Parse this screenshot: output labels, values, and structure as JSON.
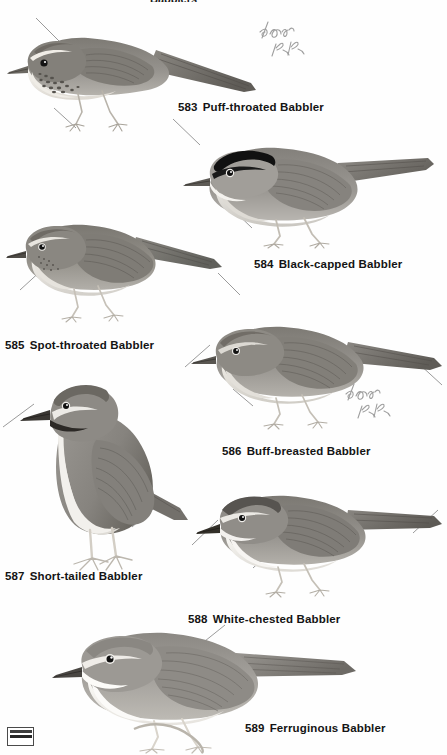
{
  "plate": {
    "title_partial": "Babblers",
    "background_color": "#fefefe",
    "text_color": "#141414",
    "leader_color": "#8e8e8e",
    "annotation_color": "#9a9a9a",
    "width": 447,
    "height": 755
  },
  "entries": [
    {
      "number": "583",
      "name": "Puff-throated Babbler",
      "caption_x": 178,
      "caption_y": 101,
      "bird": {
        "x": 6,
        "y": 28,
        "w": 250,
        "h": 110,
        "pose": "perched-left-facing",
        "plumage": {
          "upper": "#8f8c87",
          "upper_dark": "#6e6b66",
          "crown": "#77736d",
          "breast": "#f2efe9",
          "streaks": "#5e5a55",
          "bill": "#6b6862",
          "legs": "#c8c3ba"
        },
        "features": "streaked breast, pale supercilium, rufous crown, long tail"
      }
    },
    {
      "number": "584",
      "name": "Black-capped Babbler",
      "caption_x": 254,
      "caption_y": 258,
      "bird": {
        "x": 178,
        "y": 140,
        "w": 255,
        "h": 105,
        "pose": "perched-left-facing",
        "plumage": {
          "upper": "#97948f",
          "upper_dark": "#74716c",
          "crown": "#121212",
          "breast": "#d6d3cd",
          "streaks": "#4a4743",
          "bill": "#5d5a55",
          "legs": "#cfcac1"
        },
        "features": "solid black cap, grey underparts, white throat"
      }
    },
    {
      "number": "585",
      "name": "Spot-throated Babbler",
      "caption_x": 5,
      "caption_y": 339,
      "bird": {
        "x": 6,
        "y": 215,
        "w": 220,
        "h": 105,
        "pose": "perched-left-facing",
        "plumage": {
          "upper": "#8b8883",
          "upper_dark": "#6b6862",
          "crown": "#7c7872",
          "breast": "#e8e5df",
          "streaks": "#5a5651",
          "bill": "#4f4c47",
          "legs": "#d2cdc4"
        },
        "features": "faintly spotted throat, plain brown upperparts"
      }
    },
    {
      "number": "586",
      "name": "Buff-breasted Babbler",
      "caption_x": 222,
      "caption_y": 445,
      "bird": {
        "x": 190,
        "y": 318,
        "w": 250,
        "h": 110,
        "pose": "perched-left-facing",
        "plumage": {
          "upper": "#8d8a85",
          "upper_dark": "#6a6762",
          "crown": "#7a7670",
          "breast": "#ddd9d2",
          "streaks": "#56534e",
          "bill": "#595651",
          "legs": "#cbc6bd"
        },
        "features": "buff breast, plain warm brown upperparts"
      }
    },
    {
      "number": "587",
      "name": "Short-tailed Babbler",
      "caption_x": 5,
      "caption_y": 570,
      "bird": {
        "x": 16,
        "y": 378,
        "w": 180,
        "h": 195,
        "pose": "upright-standing",
        "plumage": {
          "upper": "#908d88",
          "upper_dark": "#6f6c67",
          "crown": "#6e6a64",
          "breast": "#edeae4",
          "streaks": "#3c3935",
          "bill": "#3a3733",
          "legs": "#d6d1c8"
        },
        "features": "upright stance, short tail, black malar stripe, white belly"
      }
    },
    {
      "number": "588",
      "name": "White-chested Babbler",
      "caption_x": 188,
      "caption_y": 613,
      "bird": {
        "x": 196,
        "y": 488,
        "w": 245,
        "h": 105,
        "pose": "perched-left-facing",
        "plumage": {
          "upper": "#8c8984",
          "upper_dark": "#6b6863",
          "crown": "#5f5c57",
          "breast": "#f1eee8",
          "streaks": "#545horizontal",
          "bill": "#333029",
          "legs": "#cdc8bf"
        },
        "features": "white chest, dark crown, grey-brown upperparts"
      }
    },
    {
      "number": "589",
      "name": "Ferruginous Babbler",
      "caption_x": 245,
      "caption_y": 722,
      "bird": {
        "x": 56,
        "y": 625,
        "w": 300,
        "h": 125,
        "pose": "perched-left-facing",
        "plumage": {
          "upper": "#9b9893",
          "upper_dark": "#7b7873",
          "crown": "#8a8782",
          "breast": "#f4f1eb",
          "streaks": "#666360",
          "bill": "#4a4743",
          "legs": "#d8d3ca"
        },
        "features": "rufous upperparts, white underparts, long tail"
      }
    }
  ],
  "annotations": [
    {
      "text": "1/06 KK",
      "x": 258,
      "y": 18,
      "rotation": -8
    },
    {
      "text": "1/06 KK",
      "x": 344,
      "y": 378,
      "rotation": -8
    }
  ],
  "stamp": {
    "label": "publisher-stamp",
    "x": 7,
    "y": 727
  }
}
